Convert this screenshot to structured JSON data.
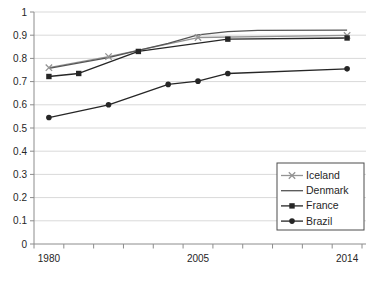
{
  "chart_data": {
    "type": "line",
    "title": "",
    "xlabel": "",
    "ylabel": "",
    "x_categories": [
      "1980",
      "1985",
      "1990",
      "1995",
      "2000",
      "2005",
      "2010",
      "2011",
      "2012",
      "2013",
      "2014"
    ],
    "x_axis_labels_shown": [
      "1980",
      "2005",
      "2014"
    ],
    "y_tick_labels_top_to_bottom": [
      "1",
      "0.9",
      "0.8",
      "0.7",
      "0.6",
      "0.5",
      "0.4",
      "0.3",
      "0.2",
      "0.1",
      "0"
    ],
    "y_tick_values": [
      1,
      0.9,
      0.8,
      0.7,
      0.6,
      0.5,
      0.4,
      0.3,
      0.2,
      0.1,
      0
    ],
    "ylim": [
      0,
      1
    ],
    "grid": "horizontal-on",
    "legend": {
      "position": "inside-right",
      "border": true,
      "entries": [
        "Iceland",
        "Denmark",
        "France",
        "Brazil"
      ]
    },
    "series": [
      {
        "name": "Iceland",
        "marker": "x",
        "color": "#949494",
        "points": [
          [
            1980,
            0.76
          ],
          [
            1990,
            0.808
          ],
          [
            2005,
            0.89
          ],
          [
            2014,
            0.899
          ]
        ]
      },
      {
        "name": "Denmark",
        "marker": "none",
        "color": "#555555",
        "points": [
          [
            1980,
            0.757
          ],
          [
            1990,
            0.803
          ],
          [
            1995,
            0.835
          ],
          [
            2000,
            0.865
          ],
          [
            2005,
            0.901
          ],
          [
            2010,
            0.915
          ],
          [
            2011,
            0.921
          ],
          [
            2014,
            0.922
          ]
        ]
      },
      {
        "name": "France",
        "marker": "square",
        "color": "#262626",
        "points": [
          [
            1980,
            0.722
          ],
          [
            1985,
            0.735
          ],
          [
            1995,
            0.83
          ],
          [
            2010,
            0.883
          ],
          [
            2014,
            0.888
          ]
        ]
      },
      {
        "name": "Brazil",
        "marker": "circle",
        "color": "#262626",
        "points": [
          [
            1980,
            0.545
          ],
          [
            1990,
            0.6
          ],
          [
            2000,
            0.688
          ],
          [
            2005,
            0.702
          ],
          [
            2010,
            0.735
          ],
          [
            2014,
            0.755
          ]
        ]
      }
    ],
    "layout_hints": {
      "background_color": "#ffffff",
      "gridline_color": "#d9d9d9",
      "axis_color": "#8c8c8c",
      "text_color": "#262626",
      "legend_border_color": "#4d4d4d"
    }
  }
}
